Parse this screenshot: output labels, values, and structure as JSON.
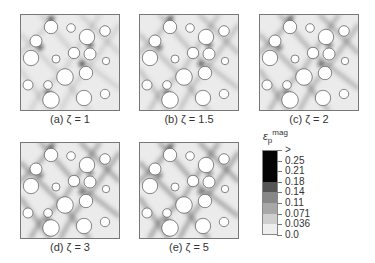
{
  "figure": {
    "panels": [
      {
        "id": "a",
        "caption": "(a) ζ = 1",
        "zeta": 1,
        "x": 20,
        "y": 14,
        "intensity": 0.35
      },
      {
        "id": "b",
        "caption": "(b) ζ = 1.5",
        "zeta": 1.5,
        "x": 139,
        "y": 14,
        "intensity": 0.55
      },
      {
        "id": "c",
        "caption": "(c) ζ = 2",
        "zeta": 2,
        "x": 259,
        "y": 14,
        "intensity": 0.7
      },
      {
        "id": "d",
        "caption": "(d) ζ = 3",
        "zeta": 3,
        "x": 20,
        "y": 142,
        "intensity": 0.85
      },
      {
        "id": "e",
        "caption": "(e) ζ = 5",
        "zeta": 5,
        "x": 139,
        "y": 142,
        "intensity": 0.9
      }
    ],
    "circles": [
      [
        31,
        13,
        6.7
      ],
      [
        51,
        14,
        4.3
      ],
      [
        67,
        23,
        7.7
      ],
      [
        85,
        17,
        5.3
      ],
      [
        16,
        27,
        6
      ],
      [
        11,
        44,
        7.7
      ],
      [
        36,
        45,
        4
      ],
      [
        54,
        39,
        5.7
      ],
      [
        70,
        40,
        6
      ],
      [
        86,
        47,
        3.7
      ],
      [
        45,
        63,
        8.3
      ],
      [
        66,
        59,
        6.7
      ],
      [
        8,
        71,
        5
      ],
      [
        28,
        71,
        4.3
      ],
      [
        31,
        86,
        8.3
      ],
      [
        64,
        84,
        7.7
      ],
      [
        85,
        80,
        4.7
      ]
    ],
    "colors": {
      "panel_bg": "#ebebeb",
      "panel_border": "#777777",
      "band": "#555555",
      "hotspot": "#111111",
      "circle_fill": "#ffffff",
      "circle_stroke": "#555555"
    }
  },
  "legend": {
    "title": "ε",
    "title_sub": "p",
    "title_sup": "mag",
    "ticks": [
      ">",
      "0.25",
      "0.21",
      "0.18",
      "0.14",
      "0.11",
      "0.071",
      "0.036",
      "0.0"
    ],
    "segments": [
      {
        "from": 0,
        "to": 3,
        "color": "#050505"
      },
      {
        "from": 3,
        "to": 4,
        "color": "#555555"
      },
      {
        "from": 4,
        "to": 5,
        "color": "#888888"
      },
      {
        "from": 5,
        "to": 6,
        "color": "#a8a8a8"
      },
      {
        "from": 6,
        "to": 7,
        "color": "#cfcfcf"
      },
      {
        "from": 7,
        "to": 8,
        "color": "#eeeeee"
      }
    ]
  }
}
